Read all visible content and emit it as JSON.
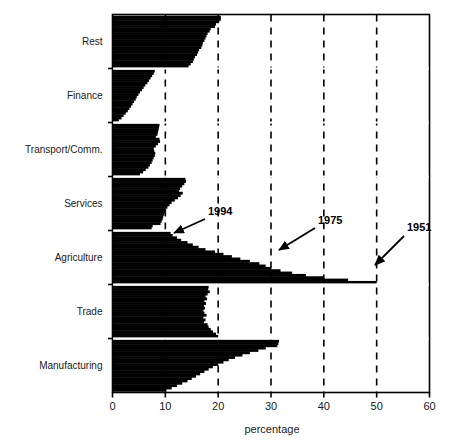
{
  "figure": {
    "name": "employment-share-by-sector-chart"
  },
  "axis": {
    "x_title": "percentage",
    "x_ticks": [
      "0",
      "10",
      "20",
      "30",
      "40",
      "50",
      "60"
    ],
    "x_tick_values": [
      0,
      10,
      20,
      30,
      40,
      50,
      60
    ],
    "x_min": 0,
    "x_max": 60,
    "gridlines_at": [
      10,
      20,
      30,
      40,
      50
    ],
    "grid_style": "dashed-vertical"
  },
  "categories": [
    "Rest",
    "Finance",
    "Transport/Comm.",
    "Services",
    "Agriculture",
    "Trade",
    "Manufacturing"
  ],
  "annotations": [
    {
      "label": "1994",
      "target_category": "Agriculture",
      "target_value": 11.0,
      "text_x": 208,
      "text_y": 215,
      "arrow_from_x": 205,
      "arrow_from_y": 219,
      "arrow_to_x": 174,
      "arrow_to_y": 233
    },
    {
      "label": "1975",
      "target_category": "Agriculture",
      "target_value": 30.0,
      "text_x": 318,
      "text_y": 224,
      "arrow_from_x": 315,
      "arrow_from_y": 228,
      "arrow_to_x": 279,
      "arrow_to_y": 250
    },
    {
      "label": "1951",
      "target_category": "Agriculture",
      "target_value": 50.0,
      "text_x": 407,
      "text_y": 231,
      "arrow_from_x": 404,
      "arrow_from_y": 236,
      "arrow_to_x": 375,
      "arrow_to_y": 265
    }
  ],
  "chart_data": {
    "type": "bar",
    "orientation": "horizontal",
    "title": "",
    "subtitle": "",
    "xlabel": "percentage",
    "ylabel": "",
    "xlim": [
      0,
      60
    ],
    "grid": true,
    "legend": "none",
    "note": "Each sector band stacks one thin horizontal bar per year, newest (1994) at the top of the band and oldest (1951) at the bottom. Values are employment share in percent.",
    "year_first": 1951,
    "year_last": 1994,
    "series": [
      {
        "name": "Rest",
        "values_top_to_bottom": [
          20.5,
          20.5,
          20.2,
          19.6,
          19.4,
          18.6,
          18.4,
          18.0,
          17.8,
          17.6,
          17.4,
          17.1,
          17.0,
          16.8,
          16.4,
          16.2,
          16.0,
          15.6,
          15.4,
          15.2,
          14.8,
          14.4
        ]
      },
      {
        "name": "Finance",
        "values_top_to_bottom": [
          8.0,
          7.8,
          7.5,
          7.2,
          6.9,
          6.6,
          6.2,
          5.9,
          5.6,
          5.2,
          4.9,
          4.6,
          4.4,
          4.1,
          3.8,
          3.5,
          3.2,
          2.9,
          2.5,
          2.1,
          1.7,
          1.2
        ]
      },
      {
        "name": "Transport/Comm.",
        "values_top_to_bottom": [
          8.9,
          8.8,
          8.7,
          8.6,
          8.5,
          8.2,
          8.9,
          9.0,
          8.6,
          8.2,
          7.8,
          7.9,
          8.1,
          8.0,
          7.8,
          7.6,
          7.4,
          7.1,
          6.8,
          6.3,
          5.8,
          5.2
        ]
      },
      {
        "name": "Services",
        "values_top_to_bottom": [
          13.8,
          13.9,
          13.6,
          13.2,
          12.8,
          12.6,
          13.3,
          12.9,
          12.4,
          11.8,
          11.2,
          10.8,
          10.4,
          10.1,
          9.9,
          9.8,
          9.6,
          9.5,
          9.3,
          9.1,
          7.6,
          7.4
        ]
      },
      {
        "name": "Agriculture",
        "values_top_to_bottom": [
          11.0,
          11.4,
          12.2,
          13.0,
          14.2,
          15.2,
          16.3,
          17.6,
          19.4,
          21.0,
          22.6,
          24.2,
          26.0,
          27.8,
          29.0,
          30.0,
          31.8,
          34.0,
          36.6,
          40.0,
          44.6,
          50.0
        ]
      },
      {
        "name": "Trade",
        "values_top_to_bottom": [
          18.2,
          18.1,
          18.4,
          18.0,
          17.6,
          17.9,
          17.4,
          17.7,
          17.3,
          17.5,
          17.2,
          17.4,
          17.8,
          17.2,
          17.6,
          17.3,
          18.0,
          18.2,
          18.6,
          19.0,
          19.6,
          20.0
        ]
      },
      {
        "name": "Manufacturing",
        "values_top_to_bottom": [
          31.5,
          31.4,
          31.2,
          29.0,
          27.6,
          26.0,
          24.6,
          23.2,
          22.0,
          21.0,
          20.0,
          19.0,
          18.2,
          17.4,
          16.6,
          15.8,
          15.0,
          14.2,
          13.2,
          12.2,
          11.2,
          10.2
        ]
      }
    ]
  },
  "colors": {
    "bar": "#000000",
    "frame": "#000000",
    "grid": "#000000",
    "background": "#ffffff",
    "text": "#1a1a1a"
  }
}
